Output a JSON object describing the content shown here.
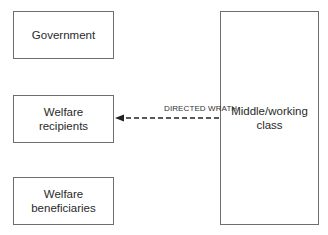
{
  "diagram": {
    "nodes": [
      {
        "id": "government",
        "line1": "Government",
        "line2": ""
      },
      {
        "id": "welfare-recipients",
        "line1": "Welfare",
        "line2": "recipients"
      },
      {
        "id": "welfare-beneficiaries",
        "line1": "Welfare",
        "line2": "beneficiaries"
      },
      {
        "id": "middle-working-class",
        "line1": "Middle/working",
        "line2": "class"
      }
    ],
    "edges": [
      {
        "from": "middle-working-class",
        "to": "welfare-recipients",
        "label": "DIRECTED WRATH",
        "style": "dashed"
      }
    ]
  },
  "colors": {
    "border": "#6e6e6e",
    "arrow": "#222222",
    "text": "#2a2a2a"
  }
}
